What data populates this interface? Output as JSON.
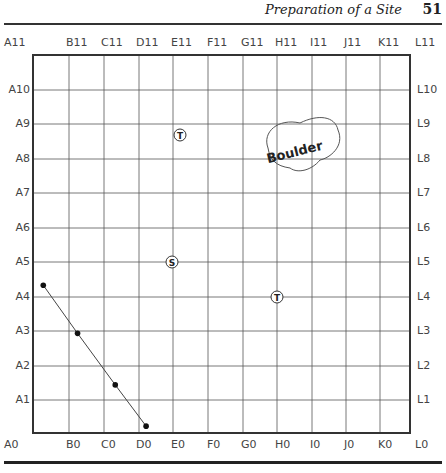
{
  "header": {
    "title": "Preparation of a Site",
    "page_number": "51"
  },
  "grid": {
    "top_labels": [
      "A11",
      "B11",
      "C11",
      "D11",
      "E11",
      "F11",
      "G11",
      "H11",
      "I11",
      "J11",
      "K11",
      "L11"
    ],
    "bottom_labels": [
      "A0",
      "B0",
      "C0",
      "D0",
      "E0",
      "F0",
      "G0",
      "H0",
      "I0",
      "J0",
      "K0",
      "L0"
    ],
    "left_labels": [
      "A10",
      "A9",
      "A8",
      "A7",
      "A6",
      "A5",
      "A4",
      "A3",
      "A2",
      "A1"
    ],
    "right_labels": [
      "L10",
      "L9",
      "L8",
      "L7",
      "L6",
      "L5",
      "L4",
      "L3",
      "L2",
      "L1"
    ]
  },
  "markers": [
    {
      "type": "tree",
      "symbol": "T",
      "location": "near E9"
    },
    {
      "type": "stake",
      "symbol": "S",
      "location": "E5"
    },
    {
      "type": "tree",
      "symbol": "T",
      "location": "H4"
    }
  ],
  "boulder": {
    "label": "Boulder",
    "location": "H8-I9"
  },
  "path_points": [
    {
      "x": 0.3,
      "y": 4.3
    },
    {
      "x": 1.3,
      "y": 2.9
    },
    {
      "x": 2.4,
      "y": 1.4
    },
    {
      "x": 3.3,
      "y": 0.2
    }
  ],
  "colors": {
    "grid_line": "#555555",
    "border": "#333333",
    "text": "#444444"
  }
}
